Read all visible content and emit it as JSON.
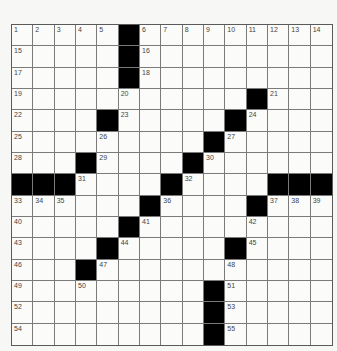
{
  "puzzle": {
    "rows": 15,
    "cols": 15,
    "colors": {
      "block": "#000000",
      "cell": "#fbfbf9",
      "line": "#7a7a7a",
      "number": "#444444"
    },
    "layout": [
      "#####X#########",
      ".....#.........",
      ".....#.........",
      "...........#...",
      "....#.....#....",
      ".........#.....",
      "...#....#......",
      "###...#.....###",
      "......#....#...",
      ".....#.........",
      "....#.....#....",
      "...#...........",
      ".........#.....",
      ".........#.....",
      ".........#....."
    ],
    "blocks": [
      [
        0,
        5
      ],
      [
        1,
        5
      ],
      [
        2,
        5
      ],
      [
        3,
        11
      ],
      [
        4,
        4
      ],
      [
        4,
        10
      ],
      [
        5,
        9
      ],
      [
        6,
        3
      ],
      [
        6,
        8
      ],
      [
        7,
        0
      ],
      [
        7,
        1
      ],
      [
        7,
        2
      ],
      [
        7,
        7
      ],
      [
        7,
        12
      ],
      [
        7,
        13
      ],
      [
        7,
        14
      ],
      [
        8,
        6
      ],
      [
        8,
        11
      ],
      [
        9,
        5
      ],
      [
        10,
        4
      ],
      [
        10,
        10
      ],
      [
        11,
        3
      ],
      [
        12,
        9
      ],
      [
        13,
        9
      ],
      [
        14,
        9
      ]
    ],
    "numbers": [
      {
        "r": 0,
        "c": 0,
        "n": "1"
      },
      {
        "r": 0,
        "c": 1,
        "n": "2"
      },
      {
        "r": 0,
        "c": 2,
        "n": "3"
      },
      {
        "r": 0,
        "c": 3,
        "n": "4"
      },
      {
        "r": 0,
        "c": 4,
        "n": "5"
      },
      {
        "r": 0,
        "c": 6,
        "n": "6"
      },
      {
        "r": 0,
        "c": 7,
        "n": "7"
      },
      {
        "r": 0,
        "c": 8,
        "n": "8"
      },
      {
        "r": 0,
        "c": 9,
        "n": "9"
      },
      {
        "r": 0,
        "c": 10,
        "n": "10"
      },
      {
        "r": 0,
        "c": 11,
        "n": "11"
      },
      {
        "r": 0,
        "c": 12,
        "n": "12"
      },
      {
        "r": 0,
        "c": 13,
        "n": "13"
      },
      {
        "r": 0,
        "c": 14,
        "n": "14"
      },
      {
        "r": 1,
        "c": 0,
        "n": "15"
      },
      {
        "r": 1,
        "c": 6,
        "n": "16"
      },
      {
        "r": 2,
        "c": 0,
        "n": "17"
      },
      {
        "r": 2,
        "c": 6,
        "n": "18"
      },
      {
        "r": 3,
        "c": 0,
        "n": "19"
      },
      {
        "r": 3,
        "c": 5,
        "n": "20"
      },
      {
        "r": 3,
        "c": 12,
        "n": "21"
      },
      {
        "r": 4,
        "c": 0,
        "n": "22"
      },
      {
        "r": 4,
        "c": 5,
        "n": "23"
      },
      {
        "r": 4,
        "c": 11,
        "n": "24"
      },
      {
        "r": 5,
        "c": 0,
        "n": "25"
      },
      {
        "r": 5,
        "c": 4,
        "n": "26"
      },
      {
        "r": 5,
        "c": 10,
        "n": "27"
      },
      {
        "r": 6,
        "c": 0,
        "n": "28"
      },
      {
        "r": 6,
        "c": 4,
        "n": "29"
      },
      {
        "r": 6,
        "c": 9,
        "n": "30"
      },
      {
        "r": 7,
        "c": 3,
        "n": "31"
      },
      {
        "r": 7,
        "c": 8,
        "n": "32"
      },
      {
        "r": 8,
        "c": 0,
        "n": "33"
      },
      {
        "r": 8,
        "c": 1,
        "n": "34"
      },
      {
        "r": 8,
        "c": 2,
        "n": "35"
      },
      {
        "r": 8,
        "c": 7,
        "n": "36"
      },
      {
        "r": 8,
        "c": 12,
        "n": "37"
      },
      {
        "r": 8,
        "c": 13,
        "n": "38"
      },
      {
        "r": 8,
        "c": 14,
        "n": "39"
      },
      {
        "r": 9,
        "c": 0,
        "n": "40"
      },
      {
        "r": 9,
        "c": 6,
        "n": "41"
      },
      {
        "r": 9,
        "c": 11,
        "n": "42"
      },
      {
        "r": 10,
        "c": 0,
        "n": "43"
      },
      {
        "r": 10,
        "c": 5,
        "n": "44"
      },
      {
        "r": 10,
        "c": 11,
        "n": "45"
      },
      {
        "r": 11,
        "c": 0,
        "n": "46"
      },
      {
        "r": 11,
        "c": 4,
        "n": "47"
      },
      {
        "r": 11,
        "c": 10,
        "n": "48"
      },
      {
        "r": 12,
        "c": 0,
        "n": "49"
      },
      {
        "r": 12,
        "c": 3,
        "n": "50"
      },
      {
        "r": 12,
        "c": 10,
        "n": "51"
      },
      {
        "r": 13,
        "c": 0,
        "n": "52"
      },
      {
        "r": 13,
        "c": 10,
        "n": "53"
      },
      {
        "r": 14,
        "c": 0,
        "n": "54"
      },
      {
        "r": 14,
        "c": 10,
        "n": "55"
      }
    ]
  }
}
